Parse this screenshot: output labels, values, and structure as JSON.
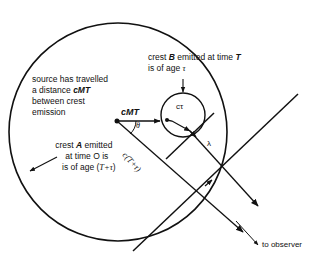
{
  "diagram": {
    "labels": {
      "source_note": [
        "source has travelled",
        "a distance cMT",
        "between crest",
        "emission"
      ],
      "crest_b": [
        "crest B emitted at time T",
        "is of age τ"
      ],
      "crest_a": [
        "crest A emitted",
        "at time O is",
        "is of age (T+τ)"
      ],
      "cMT": "cMT",
      "theta": "θ",
      "c_tau": "cτ",
      "c_T_tau": "c(T+τ)",
      "lambda": "λ",
      "to_observer": "to observer"
    },
    "text_parts": {
      "source_line1": "source has travelled",
      "source_line2_prefix": "a distance ",
      "source_line2_var": "cMT",
      "source_line3": "between crest",
      "source_line4": "emission",
      "crestb_line1_a": "crest ",
      "crestb_line1_var": "B",
      "crestb_line1_b": " emitted at time ",
      "crestb_line1_var2": "T",
      "crestb_line2_a": "is of age ",
      "crestb_line2_var": "τ",
      "cresta_line1_a": "crest ",
      "cresta_line1_var": "A",
      "cresta_line1_b": " emitted",
      "cresta_line2": "at time O is",
      "cresta_line3_a": "is of age (",
      "cresta_line3_var": "T+τ",
      "cresta_line3_b": ")"
    },
    "colors": {
      "stroke": "#111111",
      "background": "#ffffff"
    }
  }
}
